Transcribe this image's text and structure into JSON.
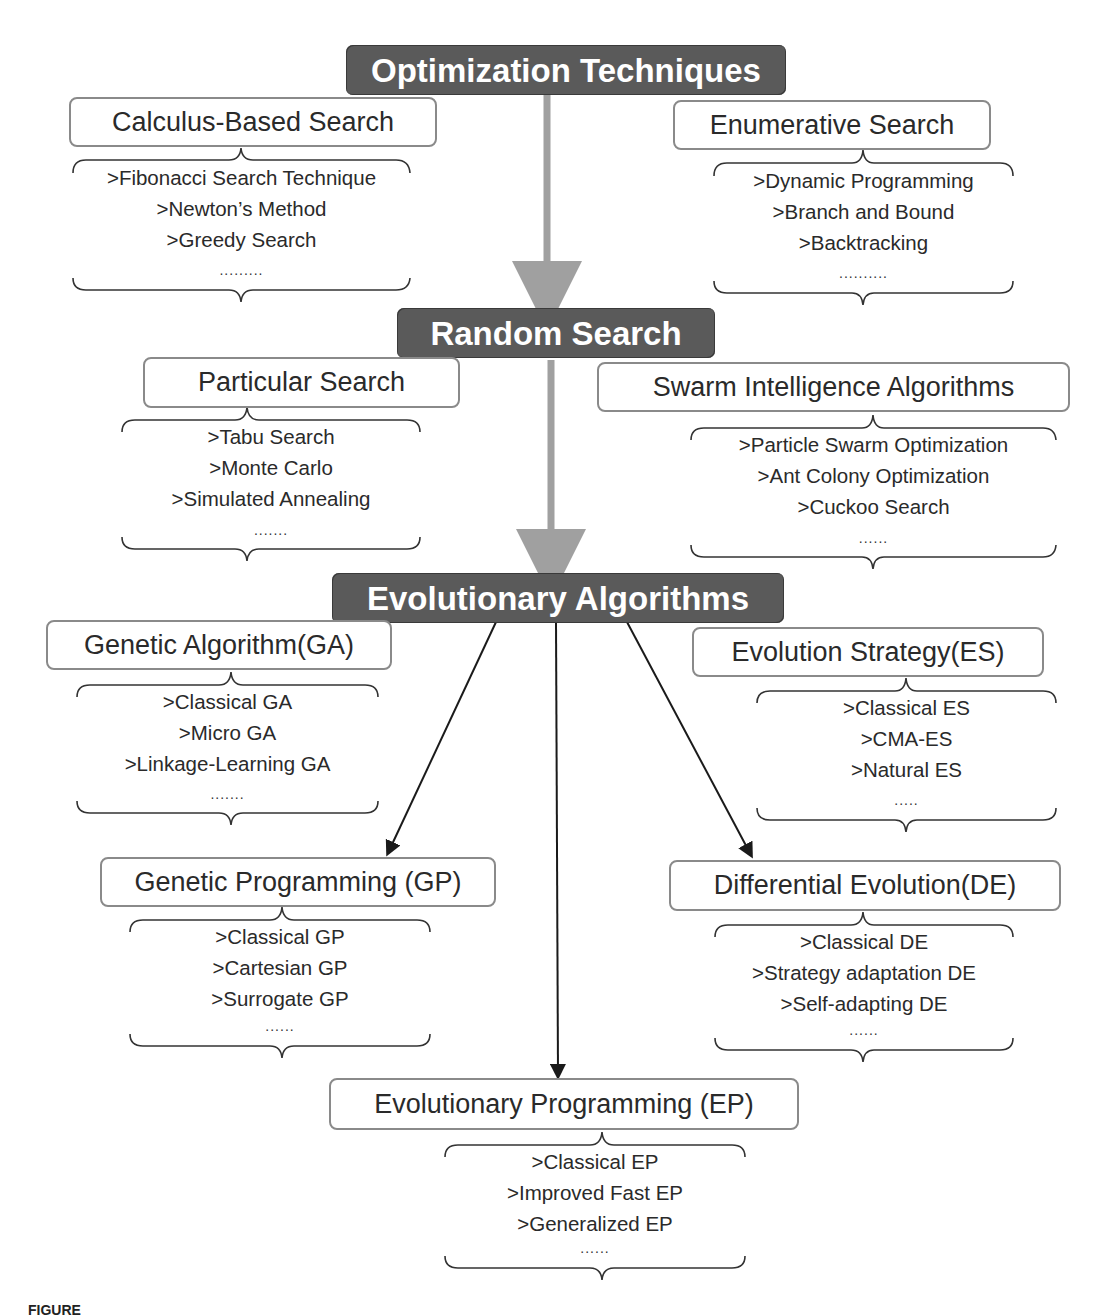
{
  "diagram": {
    "colors": {
      "dark_box_fill": "#5a5a5a",
      "dark_box_text": "#ffffff",
      "light_box_border": "#8a8a8a",
      "gray_arrow": "#a0a0a0",
      "black_arrow": "#1a1a1a"
    },
    "levels": [
      {
        "title": "Optimization Techniques",
        "children": [
          {
            "title": "Calculus-Based Search",
            "items": [
              ">Fibonacci Search Technique",
              ">Newton’s Method",
              ">Greedy Search"
            ],
            "ellipsis": "........."
          },
          {
            "title": "Enumerative Search",
            "items": [
              ">Dynamic Programming",
              ">Branch and Bound",
              ">Backtracking"
            ],
            "ellipsis": ".........."
          }
        ]
      },
      {
        "title": "Random Search",
        "children": [
          {
            "title": "Particular Search",
            "items": [
              ">Tabu Search",
              ">Monte Carlo",
              ">Simulated Annealing"
            ],
            "ellipsis": "......."
          },
          {
            "title": "Swarm Intelligence Algorithms",
            "items": [
              ">Particle Swarm Optimization",
              ">Ant Colony Optimization",
              ">Cuckoo Search"
            ],
            "ellipsis": "......"
          }
        ]
      },
      {
        "title": "Evolutionary Algorithms",
        "children": [
          {
            "title": "Genetic Algorithm(GA)",
            "items": [
              ">Classical GA",
              ">Micro GA",
              ">Linkage-Learning GA"
            ],
            "ellipsis": "......."
          },
          {
            "title": "Evolution Strategy(ES)",
            "items": [
              ">Classical ES",
              ">CMA-ES",
              ">Natural ES"
            ],
            "ellipsis": "....."
          },
          {
            "title": "Genetic Programming (GP)",
            "items": [
              ">Classical GP",
              ">Cartesian GP",
              ">Surrogate GP"
            ],
            "ellipsis": "......"
          },
          {
            "title": "Differential Evolution(DE)",
            "items": [
              ">Classical DE",
              ">Strategy adaptation DE",
              ">Self-adapting DE"
            ],
            "ellipsis": "......"
          },
          {
            "title": "Evolutionary Programming (EP)",
            "items": [
              ">Classical EP",
              ">Improved Fast EP",
              ">Generalized EP"
            ],
            "ellipsis": "......"
          }
        ]
      }
    ],
    "caption": "FIGURE"
  }
}
